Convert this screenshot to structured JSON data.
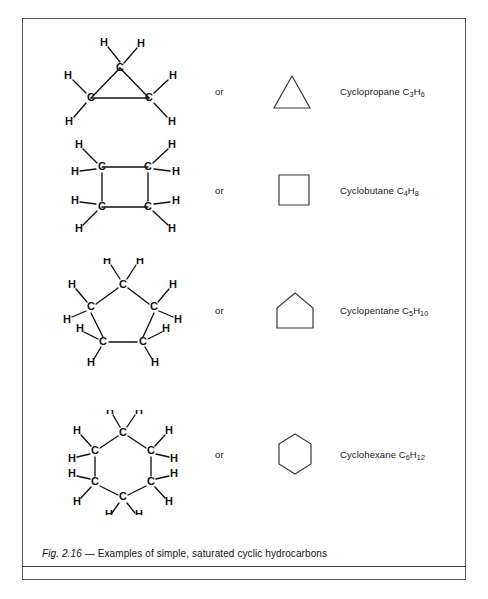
{
  "figure": {
    "caption_prefix": "Fig. 2.16",
    "caption_dash": " — ",
    "caption_text": "Examples of simple, saturated cyclic hydrocarbons",
    "border_color": "#555555",
    "ink_color": "#111111"
  },
  "connector": {
    "label": "or"
  },
  "rows": [
    {
      "id": "cyclopropane",
      "name": "Cyclopropane",
      "formula_c": "C",
      "formula_c_sub": "3",
      "formula_h": "H",
      "formula_h_sub": "6",
      "full_label": "Cyclopropane C3H6",
      "connector": "or",
      "skeleton_shape": "triangle",
      "carbon_count": 3,
      "hydrogen_count": 6,
      "atom_carbon": "C",
      "atom_hydrogen": "H"
    },
    {
      "id": "cyclobutane",
      "name": "Cyclobutane",
      "formula_c": "C",
      "formula_c_sub": "4",
      "formula_h": "H",
      "formula_h_sub": "8",
      "full_label": "Cyclobutane C4H8",
      "connector": "or",
      "skeleton_shape": "square",
      "carbon_count": 4,
      "hydrogen_count": 8,
      "atom_carbon": "C",
      "atom_hydrogen": "H"
    },
    {
      "id": "cyclopentane",
      "name": "Cyclopentane",
      "formula_c": "C",
      "formula_c_sub": "5",
      "formula_h": "H",
      "formula_h_sub": "10",
      "full_label": "Cyclopentane C5H10",
      "connector": "or",
      "skeleton_shape": "pentagon",
      "carbon_count": 5,
      "hydrogen_count": 10,
      "atom_carbon": "C",
      "atom_hydrogen": "H"
    },
    {
      "id": "cyclohexane",
      "name": "Cyclohexane",
      "formula_c": "C",
      "formula_c_sub": "6",
      "formula_h": "H",
      "formula_h_sub": "12",
      "full_label": "Cyclohexane C6H12",
      "connector": "or",
      "skeleton_shape": "hexagon",
      "carbon_count": 6,
      "hydrogen_count": 12,
      "atom_carbon": "C",
      "atom_hydrogen": "H"
    }
  ]
}
